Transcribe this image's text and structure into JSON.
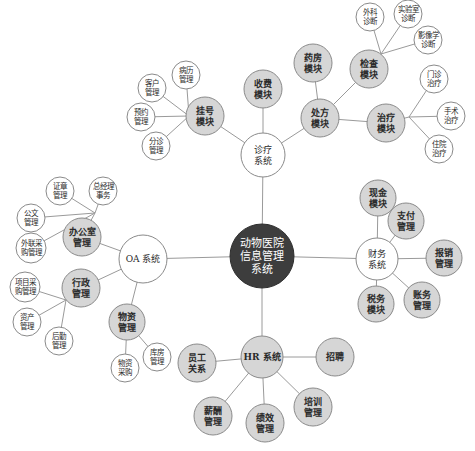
{
  "diagram": {
    "type": "mind-map",
    "colors": {
      "root_fill": "#3d3d3d",
      "root_text": "#ffffff",
      "module_fill": "#d6d6d6",
      "leaf_fill": "#ffffff",
      "stroke": "#8a8a8a",
      "line": "#9a9a9a",
      "text": "#2a2a2a"
    },
    "nodes": [
      {
        "id": "root",
        "label": [
          "动物医院",
          "信息管理",
          "系统"
        ],
        "x": 262,
        "y": 256,
        "r": 32,
        "style": "root"
      },
      {
        "id": "oa",
        "label": [
          "OA 系统"
        ],
        "x": 143,
        "y": 259,
        "r": 24,
        "style": "leaf",
        "parent": "root"
      },
      {
        "id": "office",
        "label": [
          "办公室",
          "管理"
        ],
        "x": 82,
        "y": 237,
        "r": 19,
        "style": "module",
        "parent": "oa"
      },
      {
        "id": "seal",
        "label": [
          "证章",
          "管理"
        ],
        "x": 60,
        "y": 191,
        "r": 14,
        "style": "leaf",
        "parent": "office"
      },
      {
        "id": "gm",
        "label": [
          "总经理",
          "事务"
        ],
        "x": 103,
        "y": 191,
        "r": 14,
        "style": "leaf",
        "parent": "office"
      },
      {
        "id": "doc",
        "label": [
          "公文",
          "管理"
        ],
        "x": 31,
        "y": 218,
        "r": 14,
        "style": "leaf",
        "parent": "office"
      },
      {
        "id": "extpur",
        "label": [
          "外联采",
          "购管理"
        ],
        "x": 31,
        "y": 248,
        "r": 15,
        "style": "leaf",
        "parent": "office"
      },
      {
        "id": "admin",
        "label": [
          "行政",
          "管理"
        ],
        "x": 81,
        "y": 288,
        "r": 19,
        "style": "module",
        "parent": "oa"
      },
      {
        "id": "projpur",
        "label": [
          "项目采",
          "购管理"
        ],
        "x": 25,
        "y": 287,
        "r": 15,
        "style": "leaf",
        "parent": "admin"
      },
      {
        "id": "asset",
        "label": [
          "资产",
          "管理"
        ],
        "x": 27,
        "y": 322,
        "r": 14,
        "style": "leaf",
        "parent": "admin"
      },
      {
        "id": "logis",
        "label": [
          "后勤",
          "管理"
        ],
        "x": 59,
        "y": 341,
        "r": 14,
        "style": "leaf",
        "parent": "admin"
      },
      {
        "id": "material",
        "label": [
          "物资",
          "管理"
        ],
        "x": 127,
        "y": 322,
        "r": 18,
        "style": "module",
        "parent": "oa"
      },
      {
        "id": "warehouse",
        "label": [
          "库房",
          "管理"
        ],
        "x": 157,
        "y": 357,
        "r": 14,
        "style": "leaf",
        "parent": "material"
      },
      {
        "id": "matpur",
        "label": [
          "物资",
          "采购"
        ],
        "x": 125,
        "y": 368,
        "r": 14,
        "style": "leaf",
        "parent": "material"
      },
      {
        "id": "hr",
        "label": [
          "HR 系统"
        ],
        "x": 262,
        "y": 357,
        "r": 21,
        "style": "module",
        "parent": "root"
      },
      {
        "id": "emprel",
        "label": [
          "员工",
          "关系"
        ],
        "x": 197,
        "y": 363,
        "r": 19,
        "style": "module",
        "parent": "hr"
      },
      {
        "id": "recruit",
        "label": [
          "招聘"
        ],
        "x": 335,
        "y": 357,
        "r": 19,
        "style": "module",
        "parent": "hr"
      },
      {
        "id": "train",
        "label": [
          "培训",
          "管理"
        ],
        "x": 313,
        "y": 407,
        "r": 19,
        "style": "module",
        "parent": "hr"
      },
      {
        "id": "perf",
        "label": [
          "绩效",
          "管理"
        ],
        "x": 265,
        "y": 423,
        "r": 19,
        "style": "module",
        "parent": "hr"
      },
      {
        "id": "salary",
        "label": [
          "薪酬",
          "管理"
        ],
        "x": 213,
        "y": 416,
        "r": 19,
        "style": "module",
        "parent": "hr"
      },
      {
        "id": "fin",
        "label": [
          "财务",
          "系统"
        ],
        "x": 377,
        "y": 259,
        "r": 21,
        "style": "leaf",
        "parent": "root"
      },
      {
        "id": "cash",
        "label": [
          "现金",
          "模块"
        ],
        "x": 378,
        "y": 198,
        "r": 18,
        "style": "module",
        "parent": "fin"
      },
      {
        "id": "pay",
        "label": [
          "支付",
          "管理"
        ],
        "x": 406,
        "y": 221,
        "r": 18,
        "style": "module",
        "parent": "fin"
      },
      {
        "id": "reimb",
        "label": [
          "报销",
          "管理"
        ],
        "x": 444,
        "y": 258,
        "r": 18,
        "style": "module",
        "parent": "fin"
      },
      {
        "id": "acct",
        "label": [
          "账务",
          "管理"
        ],
        "x": 422,
        "y": 300,
        "r": 18,
        "style": "module",
        "parent": "fin"
      },
      {
        "id": "tax",
        "label": [
          "税务",
          "模块"
        ],
        "x": 376,
        "y": 304,
        "r": 18,
        "style": "module",
        "parent": "fin"
      },
      {
        "id": "diag",
        "label": [
          "诊疗",
          "系统"
        ],
        "x": 263,
        "y": 155,
        "r": 22,
        "style": "leaf",
        "parent": "root"
      },
      {
        "id": "charge",
        "label": [
          "收费",
          "模块"
        ],
        "x": 263,
        "y": 89,
        "r": 19,
        "style": "module",
        "parent": "diag"
      },
      {
        "id": "presc",
        "label": [
          "处方",
          "模块"
        ],
        "x": 320,
        "y": 118,
        "r": 19,
        "style": "module",
        "parent": "diag"
      },
      {
        "id": "pharm",
        "label": [
          "药房",
          "模块"
        ],
        "x": 313,
        "y": 63,
        "r": 19,
        "style": "module",
        "parent": "presc"
      },
      {
        "id": "exam",
        "label": [
          "检查",
          "模块"
        ],
        "x": 369,
        "y": 69,
        "r": 19,
        "style": "module",
        "parent": "presc"
      },
      {
        "id": "treat",
        "label": [
          "治疗",
          "模块"
        ],
        "x": 386,
        "y": 123,
        "r": 19,
        "style": "module",
        "parent": "presc"
      },
      {
        "id": "surgdiag",
        "label": [
          "外科",
          "诊断"
        ],
        "x": 370,
        "y": 17,
        "r": 14,
        "style": "leaf",
        "parent": "exam"
      },
      {
        "id": "labdiag",
        "label": [
          "实验室",
          "诊断"
        ],
        "x": 408,
        "y": 14,
        "r": 14,
        "style": "leaf",
        "parent": "exam"
      },
      {
        "id": "imgdiag",
        "label": [
          "影像学",
          "诊断"
        ],
        "x": 428,
        "y": 40,
        "r": 14,
        "style": "leaf",
        "parent": "exam"
      },
      {
        "id": "outpt",
        "label": [
          "门诊",
          "治疗"
        ],
        "x": 434,
        "y": 79,
        "r": 14,
        "style": "leaf",
        "parent": "treat"
      },
      {
        "id": "surgery",
        "label": [
          "手术",
          "治疗"
        ],
        "x": 451,
        "y": 116,
        "r": 14,
        "style": "leaf",
        "parent": "treat"
      },
      {
        "id": "inpt",
        "label": [
          "住院",
          "治疗"
        ],
        "x": 439,
        "y": 149,
        "r": 14,
        "style": "leaf",
        "parent": "treat"
      },
      {
        "id": "reg",
        "label": [
          "挂号",
          "模块"
        ],
        "x": 205,
        "y": 116,
        "r": 19,
        "style": "module",
        "parent": "diag"
      },
      {
        "id": "record",
        "label": [
          "病历",
          "管理"
        ],
        "x": 186,
        "y": 75,
        "r": 14,
        "style": "leaf",
        "parent": "reg"
      },
      {
        "id": "client",
        "label": [
          "客户",
          "管理"
        ],
        "x": 152,
        "y": 88,
        "r": 14,
        "style": "leaf",
        "parent": "reg"
      },
      {
        "id": "appt",
        "label": [
          "预约",
          "管理"
        ],
        "x": 141,
        "y": 117,
        "r": 14,
        "style": "leaf",
        "parent": "reg"
      },
      {
        "id": "triage",
        "label": [
          "分诊",
          "管理"
        ],
        "x": 156,
        "y": 146,
        "r": 14,
        "style": "leaf",
        "parent": "reg"
      }
    ],
    "junctions": {
      "office": [
        95,
        213
      ],
      "admin": [
        66,
        300
      ],
      "exam": [
        381,
        54
      ],
      "treat": [
        409,
        117
      ],
      "reg": [
        189,
        116
      ]
    }
  }
}
